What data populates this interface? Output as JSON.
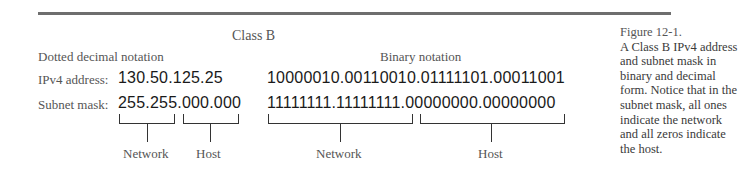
{
  "diagram": {
    "title": "Class B",
    "columns": {
      "decimal_heading": "Dotted decimal notation",
      "binary_heading": "Binary notation"
    },
    "rows": [
      {
        "label": "IPv4 address:",
        "decimal": "130.50.125.25",
        "binary": "10000010.00110010.01111101.00011001"
      },
      {
        "label": "Subnet mask:",
        "decimal_network": "255.255",
        "decimal_host": ".000.000",
        "binary_network": "11111111.11111111",
        "binary_host": ".00000000.00000000"
      }
    ],
    "brackets": {
      "decimal_network_label": "Network",
      "decimal_host_label": "Host",
      "binary_network_label": "Network",
      "binary_host_label": "Host"
    }
  },
  "caption": {
    "figure_number": "Figure 12-1.",
    "text": "A Class B IPv4 address and subnet mask in binary and decimal form. Notice that in the subnet mask, all ones indicate the network and all zeros indicate the host."
  }
}
